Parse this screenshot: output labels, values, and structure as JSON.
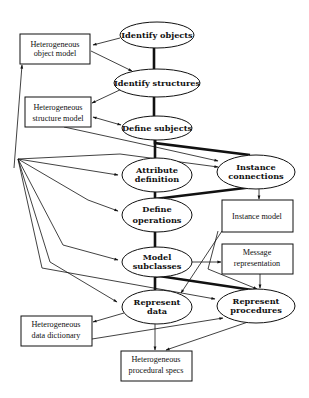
{
  "diagram": {
    "type": "process flow (object-oriented analysis steps with heterogeneous model outputs)",
    "processes": [
      {
        "id": "identify_objects",
        "lines": [
          "Identify objects"
        ]
      },
      {
        "id": "identify_structures",
        "lines": [
          "Identify structures"
        ]
      },
      {
        "id": "define_subjects",
        "lines": [
          "Define subjects"
        ]
      },
      {
        "id": "attribute_definition",
        "lines": [
          "Attribute",
          "definition"
        ]
      },
      {
        "id": "instance_connections",
        "lines": [
          "Instance",
          "connections"
        ]
      },
      {
        "id": "define_operations",
        "lines": [
          "Define",
          "operations"
        ]
      },
      {
        "id": "model_subclasses",
        "lines": [
          "Model",
          "subclasses"
        ]
      },
      {
        "id": "represent_data",
        "lines": [
          "Represent",
          "data"
        ]
      },
      {
        "id": "represent_procedures",
        "lines": [
          "Represent",
          "procedures"
        ]
      }
    ],
    "artifacts": [
      {
        "id": "het_object_model",
        "lines": [
          "Heterogeneous",
          "object model"
        ]
      },
      {
        "id": "het_structure_model",
        "lines": [
          "Heterogeneous",
          "structure model"
        ]
      },
      {
        "id": "instance_model",
        "lines": [
          "Instance model"
        ]
      },
      {
        "id": "message_representation",
        "lines": [
          "Message",
          "representation"
        ]
      },
      {
        "id": "het_data_dictionary",
        "lines": [
          "Heterogeneous",
          "data dictionary"
        ]
      },
      {
        "id": "het_procedural_specs",
        "lines": [
          "Heterogeneous",
          "procedural specs"
        ]
      }
    ],
    "sequence_links_thick": [
      [
        "identify_objects",
        "identify_structures"
      ],
      [
        "identify_structures",
        "define_subjects"
      ],
      [
        "define_subjects",
        "attribute_definition"
      ],
      [
        "define_subjects",
        "instance_connections"
      ],
      [
        "attribute_definition",
        "define_operations"
      ],
      [
        "instance_connections",
        "define_operations"
      ],
      [
        "define_operations",
        "model_subclasses"
      ],
      [
        "model_subclasses",
        "represent_data"
      ],
      [
        "model_subclasses",
        "represent_procedures"
      ]
    ],
    "arrows": [
      [
        "identify_objects",
        "het_object_model"
      ],
      [
        "het_object_model",
        "identify_structures"
      ],
      [
        "identify_structures",
        "het_structure_model"
      ],
      [
        "het_structure_model",
        "define_subjects"
      ],
      [
        "define_subjects",
        "het_structure_model"
      ],
      [
        "het_structure_model",
        "instance_connections"
      ],
      [
        "instance_connections",
        "instance_model"
      ],
      [
        "model_subclasses",
        "message_representation"
      ],
      [
        "message_representation",
        "represent_procedures"
      ],
      [
        "instance_model",
        "represent_data"
      ],
      [
        "instance_model",
        "represent_procedures"
      ],
      [
        "represent_data",
        "het_data_dictionary"
      ],
      [
        "het_data_dictionary",
        "represent_procedures"
      ],
      [
        "represent_data",
        "het_procedural_specs"
      ],
      [
        "represent_procedures",
        "het_procedural_specs"
      ],
      [
        "hub",
        "het_object_model"
      ],
      [
        "hub",
        "attribute_definition"
      ],
      [
        "hub",
        "instance_connections"
      ],
      [
        "hub",
        "define_operations"
      ],
      [
        "hub",
        "model_subclasses"
      ],
      [
        "hub",
        "represent_data"
      ],
      [
        "hub",
        "represent_procedures"
      ]
    ]
  }
}
